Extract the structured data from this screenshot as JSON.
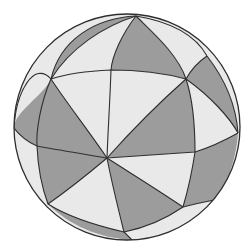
{
  "figure": {
    "type": "spherical-tessellation",
    "width": 251,
    "height": 248
  },
  "colors": {
    "background": "#ffffff",
    "dark_fill": "#9c9c9c",
    "light_fill": "#e9e9e9",
    "stroke": "#2e2e2e"
  },
  "sphere": {
    "cx": 127,
    "cy": 127,
    "r": 113
  },
  "regions": [
    {
      "id": "r1",
      "shade": "light",
      "d": "M14,128 C16,92 34,60 51,79 C43,96 14,112 14,128 Z"
    },
    {
      "id": "r2",
      "shade": "dark",
      "d": "M51,79 C60,40 95,18 136,16 C104,26 70,48 51,79 Z"
    },
    {
      "id": "r3",
      "shade": "light",
      "d": "M51,79 C70,48 104,26 136,16 C122,34 112,56 111,70 C88,71 66,74 51,79 Z"
    },
    {
      "id": "r4",
      "shade": "dark",
      "d": "M136,16 C150,30 178,54 186,79 C160,72 132,70 111,70 C112,56 122,34 136,16 Z"
    },
    {
      "id": "r5",
      "shade": "light",
      "d": "M136,16 C172,22 196,36 207,56 C198,62 191,70 186,79 C178,54 150,30 136,16 Z"
    },
    {
      "id": "r6",
      "shade": "dark",
      "d": "M207,56 C224,78 236,104 238,133 C230,118 210,96 186,79 C191,70 198,62 207,56 Z"
    },
    {
      "id": "r7",
      "shade": "light",
      "d": "M186,79 C210,96 230,118 238,133 C222,142 208,148 195,152 C195,126 193,100 186,79 Z"
    },
    {
      "id": "r8",
      "shade": "dark",
      "d": "M14,128 C14,112 43,96 51,79 C40,104 36,132 37,146 C28,142 20,136 14,128 Z"
    },
    {
      "id": "r9",
      "shade": "light",
      "d": "M51,79 C66,74 88,71 111,70 C110,100 108,130 107,158 C88,130 66,102 51,79 Z"
    },
    {
      "id": "r10",
      "shade": "dark",
      "d": "M51,79 C66,102 88,130 107,158 C84,154 58,150 37,146 C36,132 40,104 51,79 Z"
    },
    {
      "id": "r11",
      "shade": "light",
      "d": "M111,70 C132,70 160,72 186,79 C160,102 132,130 107,158 C108,130 110,100 111,70 Z"
    },
    {
      "id": "r12",
      "shade": "dark",
      "d": "M186,79 C193,100 195,126 195,152 C166,154 136,156 107,158 C132,130 160,102 186,79 Z"
    },
    {
      "id": "r13",
      "shade": "light",
      "d": "M14,128 C20,136 28,142 37,146 C38,168 42,188 48,204 C28,184 16,158 14,128 Z"
    },
    {
      "id": "r14",
      "shade": "dark",
      "d": "M37,146 C58,150 84,154 107,158 C88,174 68,190 48,204 C42,188 38,168 37,146 Z"
    },
    {
      "id": "r15",
      "shade": "light",
      "d": "M107,158 C136,156 166,154 195,152 C192,172 188,190 183,207 C158,190 132,174 107,158 Z"
    },
    {
      "id": "r16",
      "shade": "dark",
      "d": "M195,152 C208,148 222,142 238,133 C236,162 226,186 214,200 C204,202 194,204 183,207 C188,190 192,172 195,152 Z"
    },
    {
      "id": "r17",
      "shade": "light",
      "d": "M48,204 C68,190 88,174 107,158 C112,184 118,208 124,232 C98,226 70,218 48,204 Z"
    },
    {
      "id": "r18",
      "shade": "dark",
      "d": "M107,158 C132,174 158,190 183,207 C164,220 144,228 124,232 C118,208 112,184 107,158 Z"
    },
    {
      "id": "r19",
      "shade": "dark",
      "d": "M48,204 C70,218 98,226 124,232 C128,236 130,238 132,240 C100,238 70,226 48,204 Z"
    },
    {
      "id": "r20",
      "shade": "light",
      "d": "M183,207 C194,204 204,202 214,200 C196,222 168,236 132,240 C130,238 128,236 124,232 C144,228 164,220 183,207 Z"
    }
  ],
  "arcs": [
    {
      "id": "a1",
      "d": "M14,128 C16,92 34,60 51,79"
    },
    {
      "id": "a2",
      "d": "M51,79 C70,48 104,26 136,16"
    },
    {
      "id": "a3",
      "d": "M51,79 C66,74 88,71 111,70 C132,70 160,72 186,79 C210,96 230,118 238,133"
    },
    {
      "id": "a4",
      "d": "M136,16 C122,34 112,56 111,70 C110,100 108,130 107,158 C112,184 118,208 124,232 C128,236 130,238 132,240"
    },
    {
      "id": "a5",
      "d": "M136,16 C150,30 178,54 186,79 C193,100 195,126 195,152 C192,172 188,190 183,207"
    },
    {
      "id": "a6",
      "d": "M207,56 C198,62 191,70 186,79 C160,102 132,130 107,158 C88,174 68,190 48,204"
    },
    {
      "id": "a7",
      "d": "M51,79 C66,102 88,130 107,158 C132,174 158,190 183,207 C194,204 204,202 214,200"
    },
    {
      "id": "a8",
      "d": "M14,128 C20,136 28,142 37,146 C58,150 84,154 107,158 C136,156 166,154 195,152 C208,148 222,142 238,133"
    },
    {
      "id": "a9",
      "d": "M51,79 C40,104 36,132 37,146 C38,168 42,188 48,204 C70,218 98,226 124,232 C144,228 164,220 183,207"
    },
    {
      "id": "a10",
      "d": "M51,79 C60,40 95,18 136,16 C172,22 196,36 207,56 C224,78 236,104 238,133"
    }
  ]
}
